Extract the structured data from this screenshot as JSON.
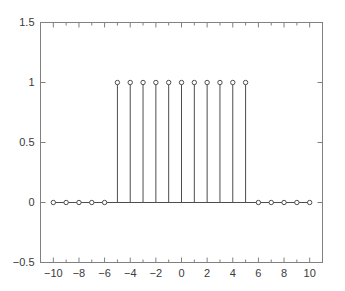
{
  "chart_data": {
    "type": "line",
    "plot_style": "stem",
    "title": "",
    "xlabel": "",
    "ylabel": "",
    "x": [
      -10,
      -9,
      -8,
      -7,
      -6,
      -5,
      -4,
      -3,
      -2,
      -1,
      0,
      1,
      2,
      3,
      4,
      5,
      6,
      7,
      8,
      9,
      10
    ],
    "values": [
      0,
      0,
      0,
      0,
      0,
      1,
      1,
      1,
      1,
      1,
      1,
      1,
      1,
      1,
      1,
      1,
      0,
      0,
      0,
      0,
      0
    ],
    "series": [
      {
        "name": "x[n]",
        "values": [
          0,
          0,
          0,
          0,
          0,
          1,
          1,
          1,
          1,
          1,
          1,
          1,
          1,
          1,
          1,
          1,
          0,
          0,
          0,
          0,
          0
        ]
      }
    ],
    "xlim": [
      -11,
      11
    ],
    "ylim": [
      -0.5,
      1.5
    ],
    "xticks": [
      -10,
      -8,
      -6,
      -4,
      -2,
      0,
      2,
      4,
      6,
      8,
      10
    ],
    "xtick_labels": [
      "−10",
      "−8",
      "−6",
      "−4",
      "−2",
      "0",
      "2",
      "4",
      "6",
      "8",
      "10"
    ],
    "xticks_minor": [
      -9,
      -7,
      -5,
      -3,
      -1,
      1,
      3,
      5,
      7,
      9
    ],
    "yticks": [
      -0.5,
      0,
      0.5,
      1,
      1.5
    ],
    "ytick_labels": [
      "−0.5",
      "0",
      "0.5",
      "1",
      "1.5"
    ],
    "grid": false,
    "legend": null,
    "baseline": 0,
    "marker": "open-circle",
    "line_color": "#4d4d4d",
    "marker_color": "#4d4d4d",
    "axis_color": "#808080",
    "tick_label_color": "#3a3a3a",
    "background_color": "#ffffff"
  }
}
